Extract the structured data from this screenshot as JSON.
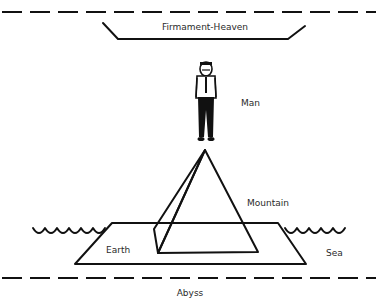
{
  "diagram": {
    "type": "cosmology-diagram",
    "labels": {
      "heaven": "Firmament-Heaven",
      "man": "Man",
      "mountain": "Mountain",
      "earth": "Earth",
      "sea": "Sea",
      "abyss": "Abyss"
    },
    "colors": {
      "ink": "#111111",
      "background": "#ffffff",
      "text": "#2a2a2a"
    }
  }
}
